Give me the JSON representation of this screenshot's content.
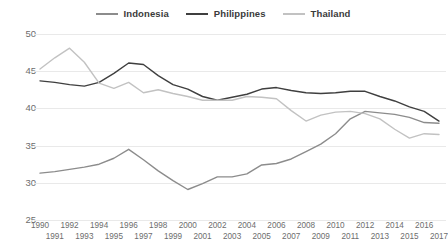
{
  "legend": {
    "position": "top-center",
    "items": [
      {
        "label": "Indonesia",
        "color": "#8c8c8c"
      },
      {
        "label": "Philippines",
        "color": "#3f3f3f"
      },
      {
        "label": "Thailand",
        "color": "#c2c2c2"
      }
    ]
  },
  "chart_data": {
    "type": "line",
    "title": "",
    "subtitle": "",
    "xlabel": "",
    "ylabel": "",
    "grid": true,
    "legend_position": "top-center",
    "ylim": [
      25,
      50
    ],
    "yticks": [
      25,
      30,
      35,
      40,
      45,
      50
    ],
    "x": [
      1990,
      1991,
      1992,
      1993,
      1994,
      1995,
      1996,
      1997,
      1998,
      1999,
      2000,
      2001,
      2002,
      2003,
      2004,
      2005,
      2006,
      2007,
      2008,
      2009,
      2010,
      2011,
      2012,
      2013,
      2014,
      2015,
      2016,
      2017
    ],
    "xtick_labels": [
      "1990",
      "1991",
      "1992",
      "1993",
      "1994",
      "1995",
      "1996",
      "1997",
      "1998",
      "1999",
      "2000",
      "2001",
      "2002",
      "2003",
      "2004",
      "2005",
      "2006",
      "2007",
      "2008",
      "2009",
      "2010",
      "2011",
      "2012",
      "2013",
      "2014",
      "2015",
      "2016",
      "2017"
    ],
    "series": [
      {
        "name": "Indonesia",
        "color": "#8c8c8c",
        "values": [
          31.3,
          31.5,
          31.8,
          32.1,
          32.5,
          33.3,
          34.5,
          33.1,
          31.6,
          30.3,
          29.1,
          29.9,
          30.8,
          30.8,
          31.2,
          32.4,
          32.6,
          33.2,
          34.2,
          35.2,
          36.6,
          38.6,
          39.6,
          39.4,
          39.2,
          38.8,
          38.1,
          38.0
        ]
      },
      {
        "name": "Philippines",
        "color": "#3f3f3f",
        "values": [
          43.7,
          43.5,
          43.2,
          43.0,
          43.5,
          44.7,
          46.1,
          45.9,
          44.4,
          43.2,
          42.6,
          41.6,
          41.1,
          41.5,
          41.9,
          42.6,
          42.8,
          42.4,
          42.1,
          42.0,
          42.1,
          42.3,
          42.3,
          41.6,
          41.0,
          40.2,
          39.6,
          38.3
        ]
      },
      {
        "name": "Thailand",
        "color": "#c2c2c2",
        "values": [
          45.3,
          46.8,
          48.1,
          46.2,
          43.4,
          42.7,
          43.5,
          42.1,
          42.5,
          42.0,
          41.6,
          41.1,
          41.1,
          41.1,
          41.6,
          41.5,
          41.3,
          39.7,
          38.3,
          39.1,
          39.5,
          39.6,
          39.3,
          38.6,
          37.2,
          36.0,
          36.6,
          36.5
        ]
      }
    ]
  }
}
